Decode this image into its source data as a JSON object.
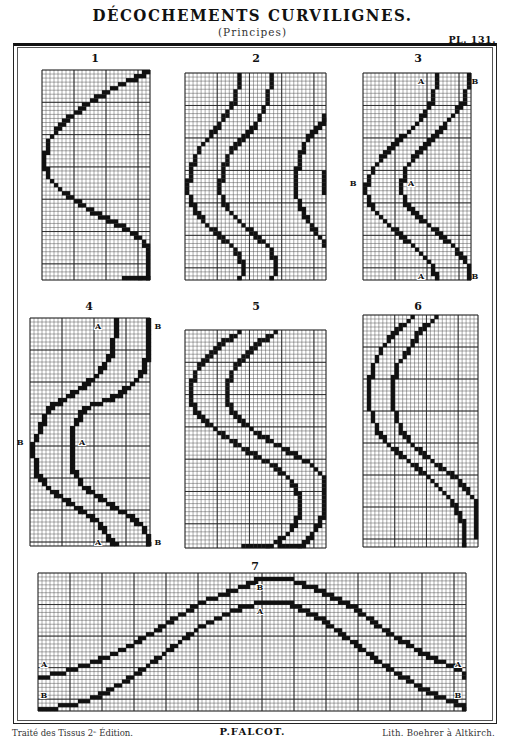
{
  "header": {
    "title": "DÉCOCHEMENTS CURVILIGNES.",
    "subtitle": "(Principes)",
    "plate_number": "PL. 131."
  },
  "figures": [
    {
      "number": "1",
      "x": 42,
      "y": 70,
      "w": 108,
      "h": 210,
      "cols": 27,
      "rows": 52,
      "curves": [
        {
          "points": [
            [
              26,
              0
            ],
            [
              19,
              3
            ],
            [
              12,
              7
            ],
            [
              5,
              12
            ],
            [
              1,
              17
            ],
            [
              0,
              22
            ],
            [
              1,
              26
            ],
            [
              5,
              30
            ],
            [
              11,
              34
            ],
            [
              19,
              38
            ],
            [
              25,
              42
            ],
            [
              28,
              47
            ],
            [
              27,
              51
            ],
            [
              20,
              54
            ]
          ],
          "thick": 2
        }
      ],
      "labels": []
    },
    {
      "number": "2",
      "x": 185,
      "y": 73,
      "w": 141,
      "h": 207,
      "cols": 35,
      "rows": 51,
      "curves": [
        {
          "points": [
            [
              13,
              0
            ],
            [
              12,
              6
            ],
            [
              8,
              12
            ],
            [
              3,
              18
            ],
            [
              1,
              23
            ],
            [
              0,
              28
            ],
            [
              2,
              33
            ],
            [
              6,
              38
            ],
            [
              12,
              43
            ],
            [
              14,
              47
            ],
            [
              13,
              51
            ]
          ],
          "thick": 2
        },
        {
          "points": [
            [
              21,
              0
            ],
            [
              20,
              6
            ],
            [
              17,
              12
            ],
            [
              11,
              18
            ],
            [
              9,
              23
            ],
            [
              8,
              28
            ],
            [
              10,
              33
            ],
            [
              15,
              38
            ],
            [
              21,
              43
            ],
            [
              22,
              47
            ],
            [
              21,
              51
            ]
          ],
          "thick": 2
        },
        {
          "points": [
            [
              35,
              10
            ],
            [
              30,
              15
            ],
            [
              28,
              20
            ],
            [
              27,
              25
            ],
            [
              27,
              29
            ],
            [
              29,
              34
            ],
            [
              33,
              40
            ],
            [
              35,
              42
            ]
          ],
          "thick": 2
        },
        {
          "points": [
            [
              35,
              24
            ],
            [
              35,
              29
            ]
          ],
          "thick": 2
        }
      ],
      "labels": []
    },
    {
      "number": "3",
      "x": 363,
      "y": 73,
      "w": 108,
      "h": 207,
      "cols": 27,
      "rows": 51,
      "curves": [
        {
          "points": [
            [
              18,
              0
            ],
            [
              17,
              6
            ],
            [
              13,
              12
            ],
            [
              6,
              18
            ],
            [
              2,
              23
            ],
            [
              0,
              28
            ],
            [
              2,
              33
            ],
            [
              7,
              38
            ],
            [
              13,
              43
            ],
            [
              17,
              47
            ],
            [
              18,
              51
            ]
          ],
          "thick": 2
        },
        {
          "points": [
            [
              26,
              0
            ],
            [
              25,
              6
            ],
            [
              20,
              12
            ],
            [
              14,
              18
            ],
            [
              10,
              23
            ],
            [
              9,
              28
            ],
            [
              11,
              33
            ],
            [
              17,
              38
            ],
            [
              23,
              43
            ],
            [
              26,
              47
            ],
            [
              26,
              51
            ]
          ],
          "thick": 2
        }
      ],
      "labels": [
        {
          "text": "A",
          "gx": 14.5,
          "gy": 2,
          "side": "in"
        },
        {
          "text": "B",
          "gx": 28,
          "gy": 2,
          "side": "out-right"
        },
        {
          "text": "B",
          "gx": -2.5,
          "gy": 27,
          "side": "out-left"
        },
        {
          "text": "A",
          "gx": 12,
          "gy": 27,
          "side": "in"
        },
        {
          "text": "A",
          "gx": 14.5,
          "gy": 50,
          "side": "in"
        },
        {
          "text": "B",
          "gx": 28,
          "gy": 50,
          "side": "out-right"
        }
      ]
    },
    {
      "number": "4",
      "x": 30,
      "y": 318,
      "w": 120,
      "h": 228,
      "cols": 30,
      "rows": 57,
      "curves": [
        {
          "points": [
            [
              21,
              0
            ],
            [
              20,
              8
            ],
            [
              16,
              14
            ],
            [
              9,
              19
            ],
            [
              4,
              22
            ],
            [
              2,
              27
            ],
            [
              0,
              31
            ],
            [
              1,
              38
            ],
            [
              5,
              43
            ],
            [
              11,
              47
            ],
            [
              17,
              51
            ],
            [
              19,
              54
            ],
            [
              21,
              57
            ]
          ],
          "thick": 3
        },
        {
          "points": [
            [
              30,
              0
            ],
            [
              29,
              8
            ],
            [
              27,
              14
            ],
            [
              21,
              19
            ],
            [
              13,
              22
            ],
            [
              10,
              27
            ],
            [
              10,
              31
            ],
            [
              10,
              37
            ],
            [
              13,
              42
            ],
            [
              19,
              46
            ],
            [
              24,
              49
            ],
            [
              28,
              52
            ],
            [
              30,
              57
            ]
          ],
          "thick": 3
        }
      ],
      "labels": [
        {
          "text": "A",
          "gx": 17,
          "gy": 2,
          "side": "in"
        },
        {
          "text": "B",
          "gx": 32,
          "gy": 2,
          "side": "out-right"
        },
        {
          "text": "B",
          "gx": -2.5,
          "gy": 31,
          "side": "out-left"
        },
        {
          "text": "A",
          "gx": 13,
          "gy": 31,
          "side": "in"
        },
        {
          "text": "A",
          "gx": 17,
          "gy": 56,
          "side": "in"
        },
        {
          "text": "B",
          "gx": 32,
          "gy": 56,
          "side": "out-right"
        }
      ]
    },
    {
      "number": "5",
      "x": 185,
      "y": 330,
      "w": 141,
      "h": 218,
      "cols": 35,
      "rows": 54,
      "curves": [
        {
          "points": [
            [
              13,
              0
            ],
            [
              8,
              3
            ],
            [
              3,
              8
            ],
            [
              1,
              13
            ],
            [
              1,
              17
            ],
            [
              3,
              21
            ],
            [
              8,
              25
            ],
            [
              14,
              29
            ],
            [
              21,
              33
            ],
            [
              26,
              37
            ],
            [
              28,
              41
            ],
            [
              28,
              45
            ],
            [
              25,
              50
            ],
            [
              19,
              54
            ],
            [
              14,
              54
            ]
          ],
          "thick": 2
        },
        {
          "points": [
            [
              22,
              0
            ],
            [
              17,
              3
            ],
            [
              12,
              8
            ],
            [
              10,
              13
            ],
            [
              10,
              17
            ],
            [
              12,
              21
            ],
            [
              17,
              25
            ],
            [
              24,
              29
            ],
            [
              31,
              33
            ],
            [
              35,
              37
            ],
            [
              35,
              41
            ],
            [
              34,
              45
            ],
            [
              31,
              50
            ],
            [
              27,
              54
            ],
            [
              23,
              54
            ]
          ],
          "thick": 2
        }
      ],
      "labels": []
    },
    {
      "number": "6",
      "x": 363,
      "y": 315,
      "w": 115,
      "h": 232,
      "cols": 29,
      "rows": 58,
      "curves": [
        {
          "points": [
            [
              12,
              0
            ],
            [
              8,
              3
            ],
            [
              4,
              8
            ],
            [
              2,
              12
            ],
            [
              1,
              17
            ],
            [
              1,
              22
            ],
            [
              3,
              28
            ],
            [
              7,
              33
            ],
            [
              12,
              37
            ],
            [
              17,
              41
            ],
            [
              22,
              46
            ],
            [
              25,
              52
            ],
            [
              25,
              58
            ]
          ],
          "thick": 2
        },
        {
          "points": [
            [
              18,
              0
            ],
            [
              14,
              3
            ],
            [
              11,
              8
            ],
            [
              8,
              12
            ],
            [
              7,
              17
            ],
            [
              7,
              22
            ],
            [
              9,
              28
            ],
            [
              13,
              33
            ],
            [
              18,
              37
            ],
            [
              24,
              41
            ],
            [
              28,
              46
            ],
            [
              30,
              52
            ],
            [
              30,
              55
            ]
          ],
          "thick": 2
        }
      ],
      "labels": []
    },
    {
      "number": "7",
      "x": 38,
      "y": 573,
      "w": 428,
      "h": 138,
      "cols": 107,
      "rows": 35,
      "curves": [
        {
          "points": [
            [
              0,
              26
            ],
            [
              8,
              24
            ],
            [
              16,
              21
            ],
            [
              24,
              17
            ],
            [
              32,
              12
            ],
            [
              40,
              7
            ],
            [
              48,
              4
            ],
            [
              55,
              1
            ],
            [
              62,
              1
            ],
            [
              70,
              4
            ],
            [
              78,
              8
            ],
            [
              86,
              14
            ],
            [
              94,
              19
            ],
            [
              100,
              22
            ],
            [
              105,
              24
            ],
            [
              107,
              26
            ]
          ],
          "thick": 2
        },
        {
          "points": [
            [
              0,
              34
            ],
            [
              8,
              33
            ],
            [
              16,
              30
            ],
            [
              24,
              25
            ],
            [
              32,
              19
            ],
            [
              40,
              13
            ],
            [
              48,
              9
            ],
            [
              55,
              7
            ],
            [
              62,
              7
            ],
            [
              70,
              11
            ],
            [
              78,
              17
            ],
            [
              86,
              23
            ],
            [
              94,
              28
            ],
            [
              100,
              31
            ],
            [
              105,
              33
            ],
            [
              107,
              34
            ]
          ],
          "thick": 2
        }
      ],
      "labels": [
        {
          "text": "B",
          "gx": 55.5,
          "gy": 3.5,
          "side": "in"
        },
        {
          "text": "A",
          "gx": 55.5,
          "gy": 9.5,
          "side": "in"
        },
        {
          "text": "A",
          "gx": 1.5,
          "gy": 23,
          "side": "in"
        },
        {
          "text": "A",
          "gx": 105,
          "gy": 23,
          "side": "in"
        },
        {
          "text": "B",
          "gx": 1.5,
          "gy": 31,
          "side": "in"
        },
        {
          "text": "B",
          "gx": 105,
          "gy": 31,
          "side": "in"
        }
      ]
    }
  ],
  "figure_number_positions": [
    {
      "x": 85,
      "y": 52
    },
    {
      "x": 246,
      "y": 52
    },
    {
      "x": 408,
      "y": 52
    },
    {
      "x": 79,
      "y": 300
    },
    {
      "x": 246,
      "y": 300
    },
    {
      "x": 408,
      "y": 300
    },
    {
      "x": 245,
      "y": 560
    }
  ],
  "footer": {
    "left": "Traité des Tissus 2ᵉ Édition.",
    "center": "P.FALCOT.",
    "right": "Lith. Boehrer à Altkirch."
  },
  "colors": {
    "ink": "#111111",
    "grid_fine": "#555555",
    "grid_major": "#222222",
    "paper": "#ffffff"
  }
}
